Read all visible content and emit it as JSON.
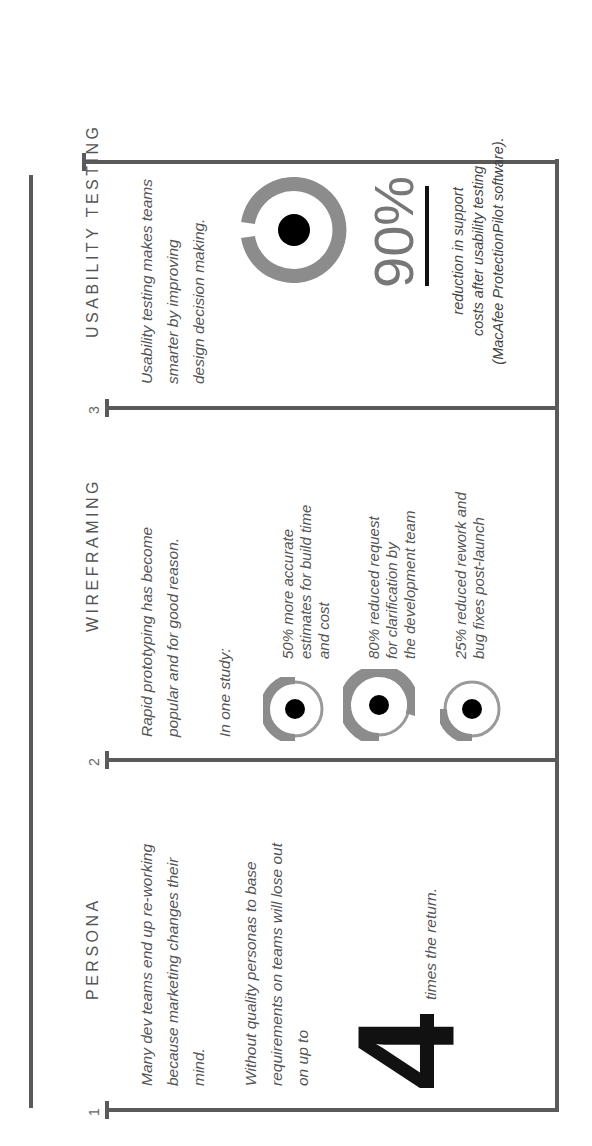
{
  "sections": [
    {
      "number": "1",
      "title": "PERSONA",
      "paragraphs": [
        "Many dev teams end up re-working because marketing changes their mind.",
        "Without quality personas to base requirements on teams will lose out on up to"
      ],
      "lines_p1": [
        "Many dev teams end up re-working",
        "because marketing changes their",
        "mind."
      ],
      "lines_p2": [
        "Without quality personas to base",
        "requirements on teams will lose out",
        "on up to"
      ],
      "big_number": "4",
      "big_number_caption": "times the return."
    },
    {
      "number": "2",
      "title": "WIREFRAMING",
      "lines_p1": [
        "Rapid prototyping has become",
        "popular and for good reason."
      ],
      "intro": "In one study:",
      "stats": [
        {
          "percent": 50,
          "lines": [
            "50% more accurate",
            "estimates for build time",
            "and cost"
          ],
          "icon": "donut-50-icon"
        },
        {
          "percent": 80,
          "lines": [
            "80% reduced request",
            "for clarification by",
            "the development team"
          ],
          "icon": "donut-80-icon"
        },
        {
          "percent": 25,
          "lines": [
            "25% reduced rework and",
            "bug fixes post-launch"
          ],
          "icon": "donut-25-icon"
        }
      ]
    },
    {
      "number": "3",
      "title": "USABILITY TESTING",
      "lines_p1": [
        "Usability testing makes teams",
        "smarter by improving",
        "design decision making."
      ],
      "stat_value": "90%",
      "stat_percent": 90,
      "caption_lines": [
        "reduction in support",
        "costs after usability testing",
        "(MacAfee ProtectionPilot software)."
      ]
    }
  ],
  "colors": {
    "line": "#5a5a5a",
    "ring": "#8c8c8c",
    "ring_thin": "#9a9a9a",
    "dot": "#000000",
    "text": "#555555"
  }
}
